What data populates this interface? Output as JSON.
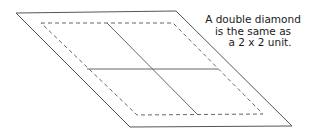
{
  "caption": {
    "lines": [
      "A double diamond",
      "is the same as",
      "a 2 x 2 unit."
    ]
  },
  "diagram": {
    "stroke_color": "#555555",
    "outer_diamond": [
      [
        16,
        13
      ],
      [
        176,
        11
      ],
      [
        292,
        126
      ],
      [
        130,
        127
      ]
    ],
    "dashed_seam": [
      [
        41,
        23
      ],
      [
        173,
        23
      ],
      [
        263,
        114
      ],
      [
        137,
        115
      ]
    ],
    "diagonal_divider": [
      [
        107,
        23
      ],
      [
        198,
        115
      ]
    ],
    "horizontal_divider": [
      [
        87,
        69
      ],
      [
        218,
        69
      ]
    ]
  }
}
